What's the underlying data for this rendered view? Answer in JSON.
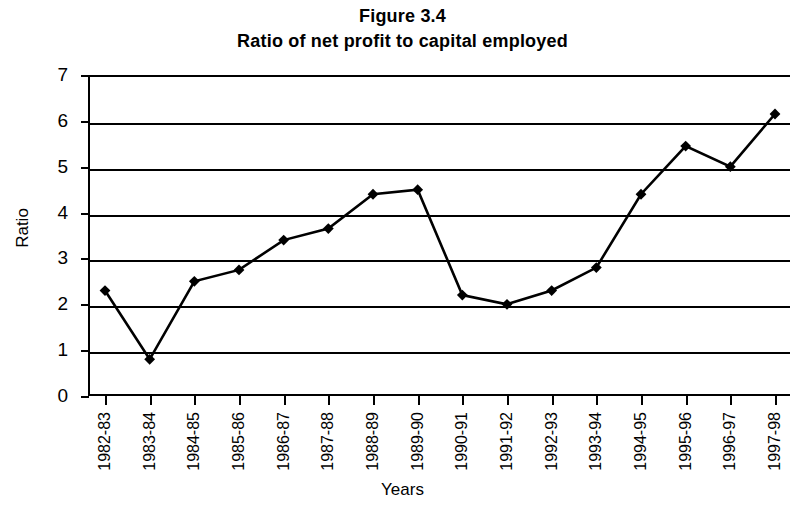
{
  "figure": {
    "title": "Figure 3.4",
    "subtitle": "Ratio of net profit to capital employed"
  },
  "axes": {
    "ylabel": "Ratio",
    "xlabel": "Years"
  },
  "chart_data": {
    "type": "line",
    "title": "Figure 3.4",
    "subtitle": "Ratio of net profit to capital employed",
    "xlabel": "Years",
    "ylabel": "Ratio",
    "ylim": [
      0,
      7
    ],
    "ytick_labels": [
      "0",
      "1",
      "2",
      "3",
      "4",
      "5",
      "6",
      "7"
    ],
    "yticks": [
      0,
      1,
      2,
      3,
      4,
      5,
      6,
      7
    ],
    "grid": true,
    "legend": false,
    "marker": "diamond",
    "line_color": "#000000",
    "marker_color": "#000000",
    "categories": [
      "1982-83",
      "1983-84",
      "1984-85",
      "1985-86",
      "1986-87",
      "1987-88",
      "1988-89",
      "1989-90",
      "1990-91",
      "1991-92",
      "1992-93",
      "1993-94",
      "1994-95",
      "1995-96",
      "1996-97",
      "1997-98"
    ],
    "values": [
      2.3,
      0.8,
      2.5,
      2.75,
      3.4,
      3.65,
      4.4,
      4.5,
      2.2,
      2.0,
      2.3,
      2.8,
      4.4,
      5.45,
      5.0,
      6.15
    ]
  }
}
